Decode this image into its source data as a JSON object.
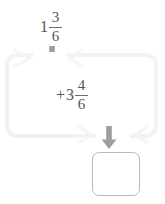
{
  "worksheet": {
    "title": "Mixed number addition",
    "expression": "1 3/6 + 3 4/6 = ?"
  },
  "top_operand": {
    "name": "first-addend",
    "whole": "1",
    "numerator": "3",
    "denominator": "6"
  },
  "addend": {
    "name": "second-addend",
    "operator": "+",
    "whole": "3",
    "numerator": "4",
    "denominator": "6"
  },
  "answer": {
    "value": "",
    "placeholder": ""
  },
  "arrows": {
    "top_label": "down-arrow",
    "bottom_label": "down-arrow"
  },
  "colors": {
    "banner_fill": "#ffffff",
    "banner_stroke": "#f2f2f2",
    "arrow": "#9e9e9e",
    "text": "#555555",
    "answer_border": "#b9b9b9",
    "background": "#ffffff"
  }
}
